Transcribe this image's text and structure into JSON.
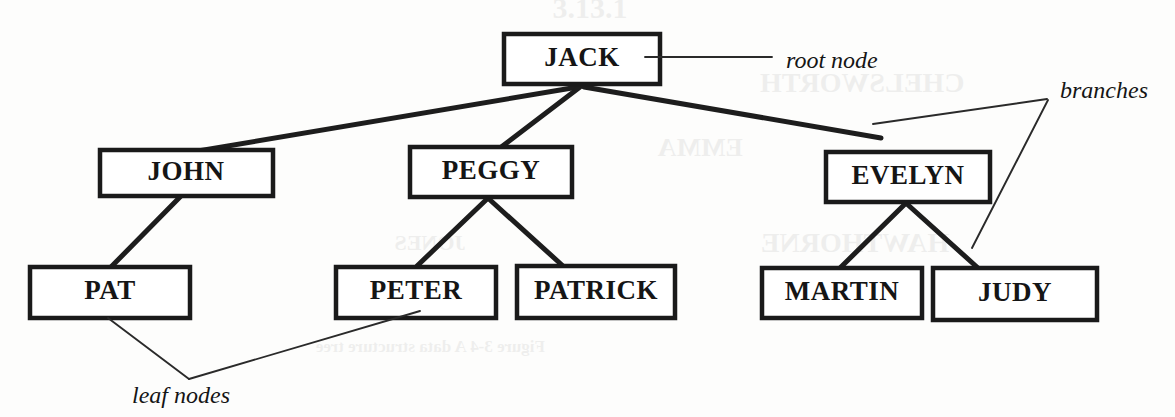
{
  "diagram": {
    "type": "tree",
    "colors": {
      "background": "#fdfdfc",
      "box_stroke": "#1a1a1a",
      "box_fill": "#ffffff",
      "branch": "#1d1d1d",
      "text": "#151515",
      "leader": "#2a2a2a"
    },
    "nodes": [
      {
        "id": "jack",
        "label": "JACK",
        "role": "root",
        "x": 504,
        "y": 34,
        "w": 156,
        "h": 50
      },
      {
        "id": "john",
        "label": "JOHN",
        "role": "branch",
        "x": 100,
        "y": 150,
        "w": 173,
        "h": 46
      },
      {
        "id": "peggy",
        "label": "PEGGY",
        "role": "branch",
        "x": 410,
        "y": 147,
        "w": 162,
        "h": 50
      },
      {
        "id": "evelyn",
        "label": "EVELYN",
        "role": "branch",
        "x": 826,
        "y": 152,
        "w": 164,
        "h": 50
      },
      {
        "id": "pat",
        "label": "PAT",
        "role": "leaf",
        "x": 30,
        "y": 267,
        "w": 160,
        "h": 51
      },
      {
        "id": "peter",
        "label": "PETER",
        "role": "leaf",
        "x": 336,
        "y": 267,
        "w": 160,
        "h": 51
      },
      {
        "id": "patrick",
        "label": "PATRICK",
        "role": "leaf",
        "x": 517,
        "y": 266,
        "w": 158,
        "h": 52
      },
      {
        "id": "martin",
        "label": "MARTIN",
        "role": "leaf",
        "x": 762,
        "y": 268,
        "w": 160,
        "h": 50
      },
      {
        "id": "judy",
        "label": "JUDY",
        "role": "leaf",
        "x": 933,
        "y": 268,
        "w": 164,
        "h": 52
      }
    ],
    "edges": [
      {
        "from": "jack",
        "to": "john"
      },
      {
        "from": "jack",
        "to": "peggy"
      },
      {
        "from": "jack",
        "to": "evelyn"
      },
      {
        "from": "john",
        "to": "pat"
      },
      {
        "from": "peggy",
        "to": "peter"
      },
      {
        "from": "peggy",
        "to": "patrick"
      },
      {
        "from": "evelyn",
        "to": "martin"
      },
      {
        "from": "evelyn",
        "to": "judy"
      }
    ],
    "annotations": [
      {
        "id": "root-node",
        "label": "root node",
        "x": 786,
        "y": 68,
        "points_to": "jack"
      },
      {
        "id": "branches",
        "label": "branches",
        "x": 1060,
        "y": 98,
        "points_to": "evelyn-edges"
      },
      {
        "id": "leaf-nodes",
        "label": "leaf nodes",
        "x": 132,
        "y": 403,
        "points_to": "pat-and-peter"
      }
    ]
  },
  "ghost_text": [
    {
      "text": "3.13.1",
      "x": 590,
      "y": 18,
      "size": 30
    },
    {
      "text": "CHELSWORTH",
      "x": 862,
      "y": 92,
      "size": 28
    },
    {
      "text": "EMMA",
      "x": 700,
      "y": 156,
      "size": 26
    },
    {
      "text": "JONES",
      "x": 430,
      "y": 250,
      "size": 22
    },
    {
      "text": "HAWTHORNE",
      "x": 855,
      "y": 252,
      "size": 28
    },
    {
      "text": "Figure 3-4 A data structure tree",
      "x": 430,
      "y": 352,
      "size": 17
    }
  ]
}
